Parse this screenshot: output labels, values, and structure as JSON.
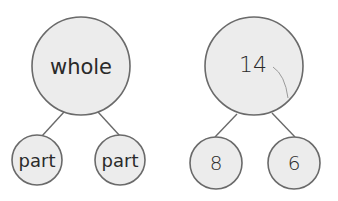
{
  "diagrams": [
    {
      "name": "generic-number-bond",
      "whole": "whole",
      "parts": [
        "part",
        "part"
      ]
    },
    {
      "name": "example-number-bond",
      "whole": "14",
      "parts": [
        "8",
        "6"
      ]
    }
  ],
  "colors": {
    "circle_fill": "#ececec",
    "stroke": "#6a6a6a",
    "text": "#2a2a2a"
  }
}
